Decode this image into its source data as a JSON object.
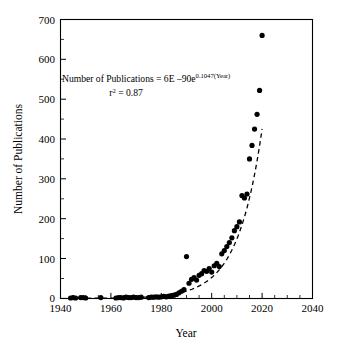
{
  "chart_data": {
    "type": "scatter",
    "title": "",
    "xlabel": "Year",
    "ylabel": "Number of Publications",
    "xlim": [
      1940,
      2040
    ],
    "ylim": [
      0,
      700
    ],
    "xticks": [
      1940,
      1960,
      1980,
      2000,
      2020,
      2040
    ],
    "yticks": [
      0,
      100,
      200,
      300,
      400,
      500,
      600,
      700
    ],
    "xtick_labels": [
      "1940",
      "1960",
      "1980",
      "2000",
      "2020",
      "2040"
    ],
    "ytick_labels": [
      "0",
      "100",
      "200",
      "300",
      "400",
      "500",
      "600",
      "700"
    ],
    "x_minor_tick_interval": 5,
    "y_minor_tick_interval": 50,
    "grid": false,
    "legend": null,
    "frame": "box",
    "marker": "filled-circle",
    "marker_color": "#000000",
    "marker_size_px": 5.2,
    "annotations": [
      {
        "name": "regression-equation",
        "text_parts": [
          {
            "text": "Number of Publications = 6E ",
            "style": "normal"
          },
          {
            "text": "–",
            "style": "normal"
          },
          {
            "text": "90e",
            "style": "normal"
          },
          {
            "text": "0.1047(Year)",
            "style": "superscript"
          }
        ],
        "plain_text": "Number of Publications = 6E –90e0.1047(Year)"
      },
      {
        "name": "r-squared",
        "text_parts": [
          {
            "text": "r",
            "style": "normal"
          },
          {
            "text": "2",
            "style": "superscript"
          },
          {
            "text": " = 0.87",
            "style": "normal"
          }
        ],
        "plain_text": "r2 = 0.87"
      }
    ],
    "trendline": {
      "type": "exponential",
      "style": "dashed",
      "color": "#000000",
      "equation": "y = 6E-90 * e^(0.1047 * Year)",
      "coefficient": 6e-90,
      "rate": 0.1047,
      "r_squared": 0.87,
      "x_start": 1944,
      "x_end": 2020
    },
    "x": [
      1944,
      1945,
      1946,
      1948,
      1949,
      1950,
      1956,
      1962,
      1963,
      1964,
      1965,
      1966,
      1967,
      1968,
      1969,
      1970,
      1971,
      1972,
      1975,
      1976,
      1977,
      1978,
      1979,
      1980,
      1981,
      1982,
      1983,
      1984,
      1985,
      1986,
      1987,
      1988,
      1989,
      1990,
      1991,
      1992,
      1993,
      1994,
      1995,
      1996,
      1997,
      1998,
      1999,
      2000,
      2001,
      2002,
      2003,
      2004,
      2005,
      2006,
      2007,
      2008,
      2009,
      2010,
      2011,
      2012,
      2013,
      2014,
      2015,
      2016,
      2017,
      2018,
      2019,
      2020
    ],
    "y": [
      1,
      2,
      1,
      2,
      2,
      1,
      2,
      1,
      2,
      2,
      1,
      3,
      2,
      2,
      3,
      2,
      2,
      3,
      2,
      3,
      3,
      4,
      3,
      4,
      5,
      4,
      6,
      7,
      8,
      10,
      14,
      18,
      22,
      105,
      38,
      48,
      52,
      46,
      58,
      62,
      70,
      68,
      75,
      66,
      82,
      88,
      80,
      112,
      120,
      130,
      140,
      152,
      170,
      180,
      192,
      258,
      252,
      262,
      350,
      384,
      425,
      462,
      522,
      660
    ]
  }
}
